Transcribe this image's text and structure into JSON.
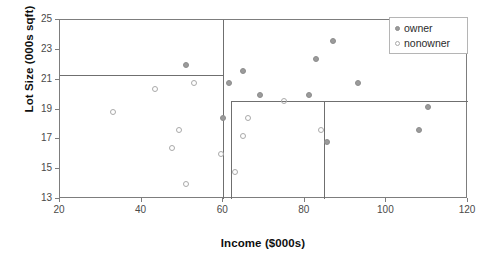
{
  "chart_data": {
    "type": "scatter",
    "title": "",
    "xlabel": "Income ($000s)",
    "ylabel": "Lot Size (000s sqft)",
    "xlim": [
      20,
      120
    ],
    "ylim": [
      13,
      25
    ],
    "xticks": [
      20,
      40,
      60,
      80,
      100,
      120
    ],
    "yticks": [
      13,
      15,
      17,
      19,
      21,
      23,
      25
    ],
    "grid": false,
    "legend_position": "top-right",
    "legend": [
      {
        "label": "owner",
        "marker": "filled-circle",
        "color": "#9b9b9b"
      },
      {
        "label": "nonowner",
        "marker": "open-circle",
        "color": "#a9a9a9"
      }
    ],
    "series": [
      {
        "name": "owner",
        "marker": "filled-circle",
        "points": [
          {
            "x": 60.0,
            "y": 18.4
          },
          {
            "x": 85.5,
            "y": 16.8
          },
          {
            "x": 64.8,
            "y": 21.6
          },
          {
            "x": 61.5,
            "y": 20.8
          },
          {
            "x": 87.0,
            "y": 23.6
          },
          {
            "x": 110.1,
            "y": 19.2
          },
          {
            "x": 108.0,
            "y": 17.6
          },
          {
            "x": 82.8,
            "y": 22.4
          },
          {
            "x": 69.0,
            "y": 20.0
          },
          {
            "x": 93.0,
            "y": 20.8
          },
          {
            "x": 51.0,
            "y": 22.0
          },
          {
            "x": 81.0,
            "y": 20.0
          }
        ]
      },
      {
        "name": "nonowner",
        "marker": "open-circle",
        "points": [
          {
            "x": 75.0,
            "y": 19.6
          },
          {
            "x": 52.8,
            "y": 20.8
          },
          {
            "x": 64.8,
            "y": 17.2
          },
          {
            "x": 43.2,
            "y": 20.4
          },
          {
            "x": 84.0,
            "y": 17.6
          },
          {
            "x": 49.2,
            "y": 17.6
          },
          {
            "x": 59.4,
            "y": 16.0
          },
          {
            "x": 66.0,
            "y": 18.4
          },
          {
            "x": 47.4,
            "y": 16.4
          },
          {
            "x": 33.0,
            "y": 18.8
          },
          {
            "x": 51.0,
            "y": 14.0
          },
          {
            "x": 63.0,
            "y": 14.8
          }
        ]
      }
    ],
    "partitions": [
      {
        "orientation": "horizontal",
        "value": 21.3,
        "from": 20,
        "to": 60
      },
      {
        "orientation": "vertical",
        "value": 60,
        "from": 13,
        "to": 25
      },
      {
        "orientation": "vertical",
        "value": 61.9,
        "from": 13,
        "to": 19.6
      },
      {
        "orientation": "horizontal",
        "value": 19.6,
        "from": 61.9,
        "to": 120
      },
      {
        "orientation": "vertical",
        "value": 84.8,
        "from": 13,
        "to": 19.6
      }
    ]
  }
}
